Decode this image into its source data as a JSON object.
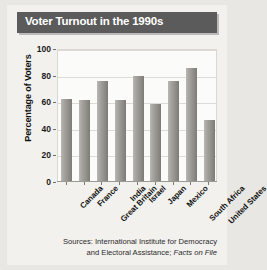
{
  "title": "Voter Turnout in the 1990s",
  "source": {
    "line1": "Sources: International Institute for Democracy",
    "line2_prefix": "and Electoral Assistance; ",
    "line2_italic": "Facts on File"
  },
  "colors": {
    "title_bar": "#5b5b5b",
    "title_text": "#ffffff",
    "bar_light": "#b9b8b4",
    "bar_dark": "#7c7b76",
    "page_background": "#e8e7e3",
    "figure_background": "#f2f1ee",
    "plot_background": "#fbfbfa",
    "gridline": "#dcdbd6",
    "axis": "#9a9a95"
  },
  "chart_data": {
    "type": "bar",
    "title": "Voter Turnout in the 1990s",
    "xlabel": "",
    "ylabel": "Percentage of Voters",
    "ylim": [
      0,
      100
    ],
    "yticks": [
      0,
      20,
      40,
      60,
      80,
      100
    ],
    "grid": true,
    "legend": "none",
    "categories": [
      "Canada",
      "France",
      "Great Britain",
      "India",
      "Israel",
      "Japan",
      "Mexico",
      "South Africa",
      "United States"
    ],
    "values": [
      62,
      61,
      75,
      61,
      79,
      58,
      75,
      85,
      46
    ]
  }
}
